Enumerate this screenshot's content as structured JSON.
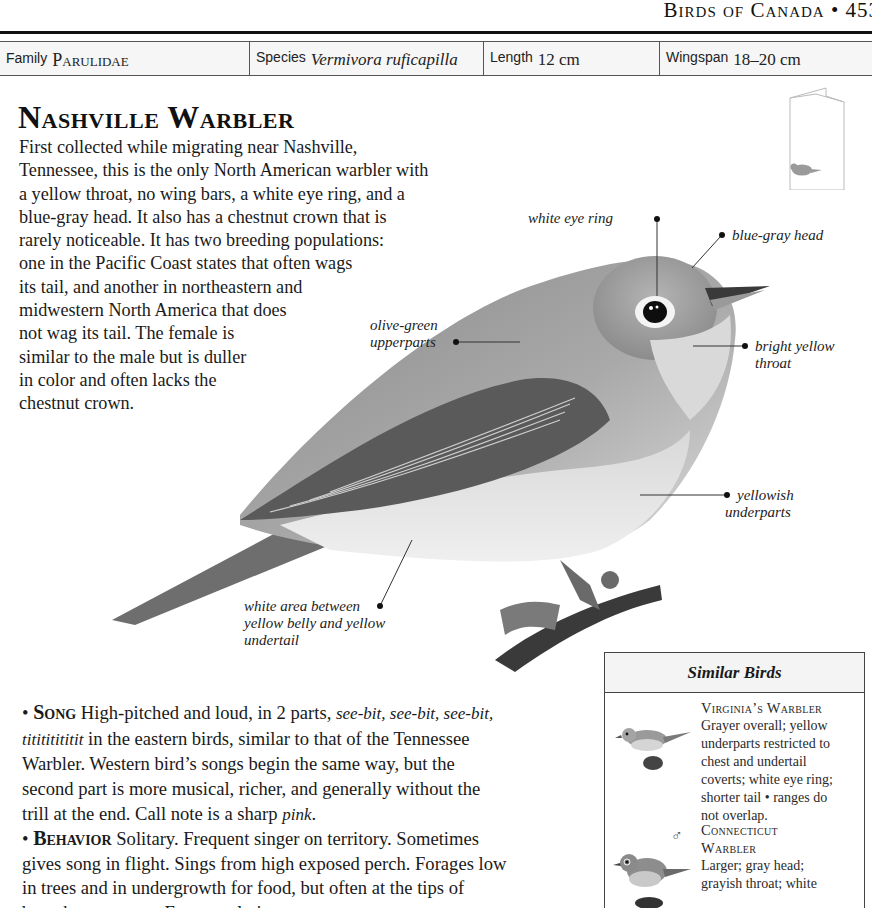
{
  "running_head": {
    "section": "Birds of Canada",
    "bullet": "•",
    "page_number": "453"
  },
  "fact_bar": {
    "family": {
      "label": "Family",
      "value": "Parulidae"
    },
    "species": {
      "label": "Species",
      "value": "Vermivora ruficapilla"
    },
    "length": {
      "label": "Length",
      "value": "12 cm"
    },
    "wingspan": {
      "label": "Wingspan",
      "value": "18–20 cm"
    }
  },
  "title": "Nashville Warbler",
  "intro_lines": [
    "First collected while migrating near Nashville,",
    "Tennessee, this is the only North American warbler with",
    "a yellow throat, no wing bars, a white eye ring, and a",
    "blue-gray head. It also has a chestnut crown that is",
    "rarely noticeable. It has two breeding populations:",
    "one in the Pacific Coast states that often wags",
    "its tail, and another in northeastern and",
    "midwestern North America that does",
    "not wag its tail. The female is",
    "similar to the male but is duller",
    "in color and often lacks the",
    "chestnut crown."
  ],
  "callouts": {
    "eye_ring": "white eye ring",
    "head": "blue-gray head",
    "upperparts_1": "olive-green",
    "upperparts_2": "upperparts",
    "throat_1": "bright yellow",
    "throat_2": "throat",
    "underparts_1": "yellowish",
    "underparts_2": "underparts",
    "white_area_1": "white area between",
    "white_area_2": "yellow belly and yellow",
    "white_area_3": "undertail"
  },
  "icons": {
    "callout_dot": "•",
    "male_symbol": "♂"
  },
  "song": {
    "heading": "Song",
    "lines": [
      {
        "pre": "High-pitched and loud, in 2 parts, ",
        "em": "see-bit, see-bit, see-bit,",
        "post": ""
      },
      {
        "pre": "",
        "em": "titititititit",
        "post": " in the eastern birds, similar to that of the Tennessee"
      },
      {
        "pre": "Warbler. Western bird’s songs begin the same way, but the",
        "em": "",
        "post": ""
      },
      {
        "pre": "second part is more musical, richer, and generally without the",
        "em": "",
        "post": ""
      },
      {
        "pre": "trill at the end. Call note is a sharp ",
        "em": "pink",
        "post": "."
      }
    ]
  },
  "behavior": {
    "heading": "Behavior",
    "lines": [
      "Solitary. Frequent singer on territory. Sometimes",
      "gives song in flight. Sings from high exposed perch. Forages low",
      "in trees and in undergrowth for food, but often at the tips of",
      "branches or stems. Eats mostly insects."
    ]
  },
  "similar_birds": {
    "title": "Similar Birds",
    "entries": [
      {
        "name": "Virginia’s Warbler",
        "lines": [
          "Grayer overall; yellow",
          "underparts restricted to",
          "chest and undertail",
          "coverts; white eye ring;",
          "shorter tail • ranges do",
          "not overlap."
        ]
      },
      {
        "name_line_1": "Connecticut",
        "name_line_2": "Warbler",
        "sex": "♂",
        "lines": [
          "Larger; gray head;",
          "grayish throat; white"
        ]
      }
    ]
  }
}
